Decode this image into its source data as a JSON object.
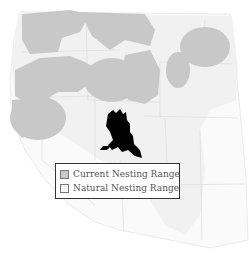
{
  "map": {
    "title": "",
    "region": "Western United States",
    "colors": {
      "current_range": "#c8c8c8",
      "natural_range": "#f1f1f1",
      "land": "#fafafa",
      "state_borders": "#d8d8d8",
      "bird": "#000000",
      "legend_border": "#333333"
    },
    "icon": "eagle-icon"
  },
  "legend": {
    "items": [
      {
        "label": "Current Nesting Range",
        "color": "#c8c8c8"
      },
      {
        "label": "Natural Nesting Range",
        "color": "#f8f8f8"
      }
    ]
  }
}
